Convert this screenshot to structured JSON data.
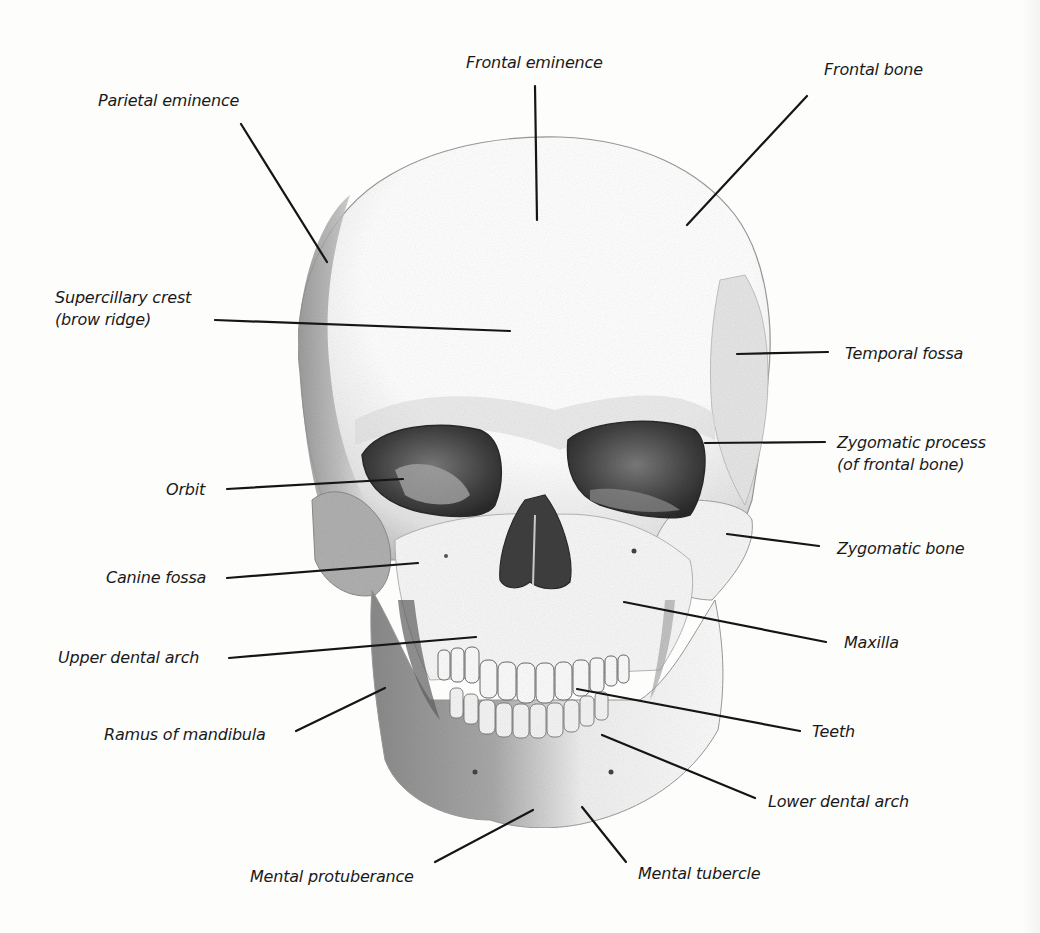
{
  "diagram": {
    "style": "grayscale pencil illustration",
    "colors": {
      "background": "#fdfdfc",
      "line": "#151515",
      "text": "#1a1a1a",
      "shading": "#8a8a8a"
    },
    "labels": [
      {
        "id": "frontal-eminence",
        "text": "Frontal eminence",
        "x": 466,
        "y": 52,
        "anchor": "left",
        "line": [
          535,
          86,
          537,
          220
        ]
      },
      {
        "id": "frontal-bone",
        "text": "Frontal bone",
        "x": 824,
        "y": 59,
        "anchor": "left",
        "line": [
          807,
          96,
          687,
          225
        ]
      },
      {
        "id": "parietal-eminence",
        "text": "Parietal eminence",
        "x": 98,
        "y": 90,
        "anchor": "left",
        "line": [
          241,
          124,
          327,
          262
        ]
      },
      {
        "id": "supercillary-crest",
        "text": "Supercillary crest",
        "text2": "(brow ridge)",
        "x": 55,
        "y": 287,
        "anchor": "left",
        "line": [
          215,
          320,
          510,
          331
        ]
      },
      {
        "id": "temporal-fossa",
        "text": "Temporal fossa",
        "x": 845,
        "y": 343,
        "anchor": "left",
        "line": [
          737,
          354,
          828,
          352
        ]
      },
      {
        "id": "zygomatic-process",
        "text": "Zygomatic process",
        "text2": "(of frontal bone)",
        "x": 837,
        "y": 432,
        "anchor": "left",
        "line": [
          705,
          443,
          825,
          442
        ]
      },
      {
        "id": "orbit",
        "text": "Orbit",
        "x": 166,
        "y": 479,
        "anchor": "left",
        "line": [
          227,
          489,
          403,
          479
        ]
      },
      {
        "id": "zygomatic-bone",
        "text": "Zygomatic bone",
        "x": 837,
        "y": 538,
        "anchor": "left",
        "line": [
          727,
          534,
          819,
          546
        ]
      },
      {
        "id": "canine-fossa",
        "text": "Canine fossa",
        "x": 106,
        "y": 567,
        "anchor": "left",
        "line": [
          227,
          578,
          418,
          563
        ]
      },
      {
        "id": "maxilla",
        "text": "Maxilla",
        "x": 844,
        "y": 632,
        "anchor": "left",
        "line": [
          624,
          602,
          826,
          642
        ]
      },
      {
        "id": "upper-dental-arch",
        "text": "Upper dental arch",
        "x": 58,
        "y": 647,
        "anchor": "left",
        "line": [
          229,
          658,
          476,
          637
        ]
      },
      {
        "id": "teeth",
        "text": "Teeth",
        "x": 812,
        "y": 721,
        "anchor": "left",
        "line": [
          577,
          689,
          800,
          731
        ]
      },
      {
        "id": "ramus-of-mandibula",
        "text": "Ramus of mandibula",
        "x": 104,
        "y": 724,
        "anchor": "left",
        "line": [
          296,
          731,
          385,
          688
        ]
      },
      {
        "id": "lower-dental-arch",
        "text": "Lower dental arch",
        "x": 768,
        "y": 791,
        "anchor": "left",
        "line": [
          602,
          735,
          755,
          798
        ]
      },
      {
        "id": "mental-protuberance",
        "text": "Mental protuberance",
        "x": 250,
        "y": 866,
        "anchor": "left",
        "line": [
          435,
          862,
          533,
          810
        ]
      },
      {
        "id": "mental-tubercle",
        "text": "Mental tubercle",
        "x": 638,
        "y": 863,
        "anchor": "left",
        "line": [
          582,
          807,
          626,
          862
        ]
      }
    ]
  }
}
